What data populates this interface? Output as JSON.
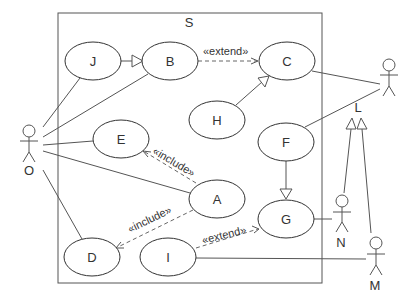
{
  "diagram": {
    "type": "uml-use-case",
    "system": {
      "label": "S"
    },
    "use_cases": [
      {
        "id": "J",
        "label": "J"
      },
      {
        "id": "B",
        "label": "B"
      },
      {
        "id": "C",
        "label": "C"
      },
      {
        "id": "H",
        "label": "H"
      },
      {
        "id": "F",
        "label": "F"
      },
      {
        "id": "E",
        "label": "E"
      },
      {
        "id": "A",
        "label": "A"
      },
      {
        "id": "G",
        "label": "G"
      },
      {
        "id": "D",
        "label": "D"
      },
      {
        "id": "I",
        "label": "I"
      }
    ],
    "actors": [
      {
        "id": "O",
        "label": "O"
      },
      {
        "id": "L",
        "label": "L"
      },
      {
        "id": "N",
        "label": "N"
      },
      {
        "id": "M",
        "label": "M"
      }
    ],
    "stereotypes": {
      "extend_b_c": "«extend»",
      "include_a_e": "«include»",
      "include_a_d": "«include»",
      "extend_i_g": "«extend»"
    },
    "relations": [
      {
        "from": "J",
        "to": "B",
        "kind": "generalization"
      },
      {
        "from": "B",
        "to": "C",
        "kind": "extend"
      },
      {
        "from": "H",
        "to": "C",
        "kind": "generalization"
      },
      {
        "from": "F",
        "to": "G",
        "kind": "generalization"
      },
      {
        "from": "A",
        "to": "E",
        "kind": "include"
      },
      {
        "from": "A",
        "to": "D",
        "kind": "include"
      },
      {
        "from": "I",
        "to": "G",
        "kind": "extend"
      },
      {
        "from": "O",
        "to": "J",
        "kind": "association"
      },
      {
        "from": "O",
        "to": "B",
        "kind": "association"
      },
      {
        "from": "O",
        "to": "E",
        "kind": "association"
      },
      {
        "from": "O",
        "to": "A",
        "kind": "association"
      },
      {
        "from": "O",
        "to": "D",
        "kind": "association"
      },
      {
        "from": "L",
        "to": "C",
        "kind": "association"
      },
      {
        "from": "L",
        "to": "F",
        "kind": "association"
      },
      {
        "from": "N",
        "to": "G",
        "kind": "association"
      },
      {
        "from": "M",
        "to": "I",
        "kind": "association"
      },
      {
        "from": "N",
        "to": "L",
        "kind": "generalization"
      },
      {
        "from": "M",
        "to": "L",
        "kind": "generalization"
      }
    ]
  }
}
